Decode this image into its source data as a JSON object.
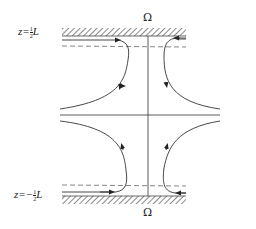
{
  "diagram": {
    "type": "stagnation-point flow between two parallel rotating walls",
    "labels": {
      "top_wall_symbol": "Ω",
      "bottom_wall_symbol": "Ω",
      "top_level_prefix": "z=",
      "top_level_num": "1",
      "top_level_den": "2",
      "top_level_suffix": "L",
      "bottom_level_prefix": "z=−",
      "bottom_level_num": "1",
      "bottom_level_den": "2",
      "bottom_level_suffix": "L"
    },
    "elements": {
      "top_wall": "hatched boundary wall at top",
      "bottom_wall": "hatched boundary wall at bottom",
      "top_dashed_line": "boundary-layer edge near top wall",
      "bottom_dashed_line": "boundary-layer edge near bottom wall",
      "vertical_axis": "rotation axis",
      "horizontal_axis": "mid-plane",
      "streamlines": 4
    },
    "colors": {
      "line": "#333333",
      "hatch": "#555555",
      "dashed": "#666666",
      "background": "#ffffff"
    }
  }
}
